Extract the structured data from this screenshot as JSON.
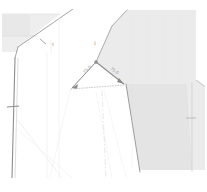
{
  "drawing": {
    "type": "cad-technical-drawing",
    "width": 207,
    "height": 192,
    "background_color": "#ffffff",
    "appearance": "faded low-contrast scanned line drawing"
  },
  "colors": {
    "background": "#ffffff",
    "fill_light_gray": "#ededed",
    "fill_right_region": "#e9e9e9",
    "line_dark": "#8d8d8d",
    "line_medium": "#a9a9a9",
    "line_faint": "#d8d8d8",
    "line_very_faint": "#e6e6e6",
    "text_gray": "#9a9a9a"
  },
  "dimensions": {
    "left_angle_label": "75.0",
    "right_angle_label": "75.0"
  },
  "tick_marks": {
    "left_label": "t",
    "right_label": "i"
  },
  "regions": {
    "left_shape_name": "left-shaded-region",
    "right_shape_name": "right-shaded-region",
    "center_annotation_name": "angular-dimension-annotation"
  },
  "geometry": {
    "apex_vertex": "96,62",
    "left_arrow_endpoint": "72,88",
    "right_arrow_endpoint": "124,84",
    "baseline_style": "dotted"
  }
}
